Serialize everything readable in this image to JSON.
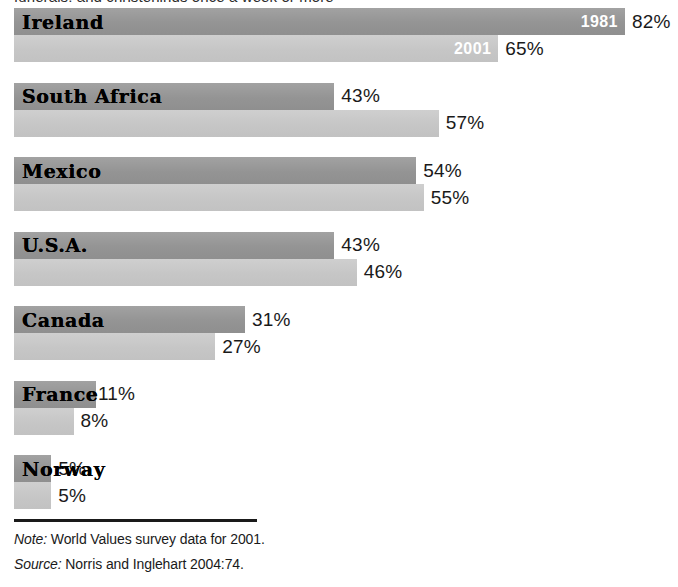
{
  "clipped_title": "funerals, and christenings once a week or more",
  "legend": {
    "series_old_label": "1981",
    "series_new_label": "2001"
  },
  "colors": {
    "bar_1981": "#9a9a9a",
    "bar_2001": "#c9c9c9",
    "text": "#1a1a1a",
    "year_tag_text": "#ffffff",
    "rule": "#1a1a1a"
  },
  "footer": {
    "note_label": "Note:",
    "note_text": "World Values survey data for 2001.",
    "source_label": "Source:",
    "source_text": "Norris and Inglehart 2004:74."
  },
  "rows": [
    {
      "country": "Ireland",
      "v1981": "82%",
      "v2001": "65%",
      "tag1981": "1981",
      "tag2001": "2001"
    },
    {
      "country": "South Africa",
      "v1981": "43%",
      "v2001": "57%",
      "tag1981": "",
      "tag2001": ""
    },
    {
      "country": "Mexico",
      "v1981": "54%",
      "v2001": "55%",
      "tag1981": "",
      "tag2001": ""
    },
    {
      "country": "U.S.A.",
      "v1981": "43%",
      "v2001": "46%",
      "tag1981": "",
      "tag2001": ""
    },
    {
      "country": "Canada",
      "v1981": "31%",
      "v2001": "27%",
      "tag1981": "",
      "tag2001": ""
    },
    {
      "country": "France",
      "v1981": "11%",
      "v2001": "8%",
      "tag1981": "",
      "tag2001": ""
    },
    {
      "country": "Norway",
      "v1981": "5%",
      "v2001": "5%",
      "tag1981": "",
      "tag2001": ""
    }
  ],
  "chart_data": {
    "type": "bar",
    "orientation": "horizontal",
    "title": "funerals, and christenings once a week or more",
    "xlabel": "",
    "ylabel": "",
    "xlim": [
      0,
      82
    ],
    "grid": false,
    "legend_position": "in-bar-labels",
    "categories": [
      "Ireland",
      "South Africa",
      "Mexico",
      "U.S.A.",
      "Canada",
      "France",
      "Norway"
    ],
    "series": [
      {
        "name": "1981",
        "color": "#9a9a9a",
        "values": [
          82,
          43,
          54,
          43,
          31,
          11,
          5
        ]
      },
      {
        "name": "2001",
        "color": "#c9c9c9",
        "values": [
          65,
          57,
          55,
          46,
          27,
          8,
          5
        ]
      }
    ],
    "data_labels": [
      {
        "category": "Ireland",
        "1981": "82%",
        "2001": "65%"
      },
      {
        "category": "South Africa",
        "1981": "43%",
        "2001": "57%"
      },
      {
        "category": "Mexico",
        "1981": "54%",
        "2001": "55%"
      },
      {
        "category": "U.S.A.",
        "1981": "43%",
        "2001": "46%"
      },
      {
        "category": "Canada",
        "1981": "31%",
        "2001": "27%"
      },
      {
        "category": "France",
        "1981": "11%",
        "2001": "8%"
      },
      {
        "category": "Norway",
        "1981": "5%",
        "2001": "5%"
      }
    ],
    "annotations": [
      "Note: World Values survey data for 2001.",
      "Source: Norris and Inglehart 2004:74."
    ]
  },
  "layout": {
    "px_per_percent": 7.45,
    "bar_origin_x": 14,
    "row_pitch": 74.5,
    "bar_height": 27
  }
}
